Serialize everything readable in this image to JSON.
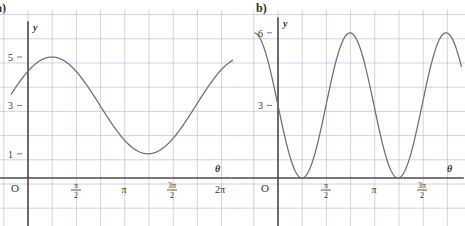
{
  "figure": {
    "background": "#ffffff",
    "grid_color": "#b9c3d2",
    "axis_color": "#4a4a4a",
    "curve_color": "#6e6e6e"
  },
  "panels": [
    {
      "id": "a",
      "part_label": "a)",
      "y_axis_name": "y",
      "x_axis_name": "θ",
      "origin_label": "O",
      "y_ticks": [
        {
          "value": 5,
          "label": "5"
        },
        {
          "value": 3,
          "label": "3"
        },
        {
          "value": 1,
          "label": "1"
        }
      ],
      "x_ticks": [
        {
          "value": 0,
          "label": "O",
          "kind": "origin"
        },
        {
          "value": 1.5707963,
          "label": "π/2",
          "kind": "fraction",
          "num": "π",
          "den": "2"
        },
        {
          "value": 3.1415927,
          "label": "π",
          "kind": "plain"
        },
        {
          "value": 4.712389,
          "label": "3π/2",
          "kind": "fraction",
          "num": "3π",
          "den": "2"
        },
        {
          "value": 6.2831853,
          "label": "2π",
          "kind": "plain"
        }
      ]
    },
    {
      "id": "b",
      "part_label": "b)",
      "y_axis_name": "y",
      "x_axis_name": "θ",
      "origin_label": "O",
      "y_ticks": [
        {
          "value": 6,
          "label": "6"
        },
        {
          "value": 3,
          "label": "3"
        }
      ],
      "x_ticks": [
        {
          "value": 0,
          "label": "O",
          "kind": "origin"
        },
        {
          "value": 1.5707963,
          "label": "π/2",
          "kind": "fraction",
          "num": "π",
          "den": "2"
        },
        {
          "value": 3.1415927,
          "label": "π",
          "kind": "plain"
        },
        {
          "value": 4.712389,
          "label": "3π/2",
          "kind": "fraction",
          "num": "3π",
          "den": "2"
        }
      ]
    }
  ],
  "chart_data": [
    {
      "type": "line",
      "id": "a",
      "title": "a)",
      "xlabel": "θ",
      "ylabel": "y",
      "xlim": [
        -0.55,
        7.2
      ],
      "ylim": [
        -1.2,
        6.6
      ],
      "xtick_labels": [
        "O",
        "π/2",
        "π",
        "3π/2",
        "2π"
      ],
      "xtick_values": [
        0,
        1.5707963,
        3.1415927,
        4.712389,
        6.2831853
      ],
      "ytick_labels": [
        "5",
        "3",
        "1"
      ],
      "ytick_values": [
        5,
        3,
        1
      ],
      "grid": true,
      "legend": "none",
      "equation": "y = 3 + 2 sin(θ + π/4)",
      "amplitude": 2,
      "midline": 3,
      "period": 6.2831853,
      "maximum": 5,
      "minimum": 1,
      "y_at_zero": 4.41,
      "series": [
        {
          "name": "y = 3 + 2 sin(θ + π/4)",
          "x": [
            -0.55,
            0.0,
            0.39,
            0.79,
            1.18,
            1.57,
            1.96,
            2.36,
            2.75,
            3.14,
            3.53,
            3.93,
            4.32,
            4.71,
            5.11,
            5.5,
            5.89,
            6.28,
            6.68,
            7.07,
            7.2
          ],
          "y": [
            2.61,
            4.41,
            4.85,
            5.0,
            4.85,
            4.41,
            3.73,
            2.9,
            2.07,
            1.41,
            1.0,
            0.9,
            1.0,
            1.59,
            2.27,
            3.1,
            3.93,
            4.41,
            4.85,
            5.0,
            4.98
          ]
        }
      ]
    },
    {
      "type": "line",
      "id": "b",
      "title": "b)",
      "xlabel": "θ",
      "ylabel": "y",
      "xlim": [
        -0.75,
        6.0
      ],
      "ylim": [
        -1.2,
        7.2
      ],
      "xtick_labels": [
        "O",
        "π/2",
        "π",
        "3π/2"
      ],
      "xtick_values": [
        0,
        1.5707963,
        3.1415927,
        4.712389
      ],
      "ytick_labels": [
        "6",
        "3"
      ],
      "ytick_values": [
        6,
        3
      ],
      "grid": true,
      "legend": "none",
      "equation": "y = 3 + 3 cos(2θ + π/2)",
      "amplitude": 3,
      "midline": 3,
      "period": 3.1415927,
      "maximum": 6,
      "minimum": 0,
      "y_at_zero": 3.0,
      "series": [
        {
          "name": "y = 3 + 3 cos(2θ + π/2)",
          "x": [
            -0.75,
            -0.55,
            -0.39,
            -0.2,
            0.0,
            0.2,
            0.39,
            0.59,
            0.79,
            0.98,
            1.18,
            1.37,
            1.57,
            1.77,
            1.96,
            2.16,
            2.36,
            2.55,
            2.75,
            2.95,
            3.14,
            3.34,
            3.53,
            3.73,
            3.93,
            4.12,
            4.32,
            4.52,
            4.71,
            4.91,
            5.11,
            5.3,
            5.5,
            5.7,
            5.9
          ],
          "y": [
            5.12,
            5.86,
            6.0,
            5.59,
            3.0,
            1.84,
            0.66,
            0.07,
            0.0,
            0.52,
            1.57,
            2.9,
            3.0,
            4.39,
            5.48,
            5.98,
            6.0,
            5.48,
            4.39,
            3.0,
            3.0,
            1.61,
            0.52,
            0.02,
            0.0,
            0.52,
            1.61,
            3.0,
            3.0,
            4.39,
            5.48,
            5.98,
            6.0,
            5.86,
            5.12
          ]
        }
      ]
    }
  ]
}
